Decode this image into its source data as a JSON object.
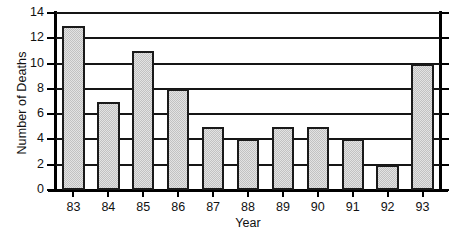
{
  "chart_data": {
    "type": "bar",
    "title": "",
    "xlabel": "Year",
    "ylabel": "Number of Deaths",
    "categories": [
      "83",
      "84",
      "85",
      "86",
      "87",
      "88",
      "89",
      "90",
      "91",
      "92",
      "93"
    ],
    "values": [
      13,
      7,
      11,
      8,
      5,
      4,
      5,
      5,
      4,
      2,
      10
    ],
    "ylim": [
      0,
      14
    ],
    "y_ticks": [
      0,
      2,
      4,
      6,
      8,
      10,
      12,
      14
    ],
    "y_tick_labels": [
      "0",
      "2",
      "4",
      "6",
      "8",
      "10",
      "12",
      "14"
    ],
    "grid": true,
    "grid_axis": "y",
    "legend": false,
    "legend_position": "none",
    "series": [
      {
        "name": "Number of Deaths",
        "values": [
          13,
          7,
          11,
          8,
          5,
          4,
          5,
          5,
          4,
          2,
          10
        ]
      }
    ],
    "colors": {
      "bar_fill": "#c2c2c2",
      "bar_edge": "#1a1a1a",
      "gridline": "#151515",
      "axis": "#000000",
      "text": "#111111",
      "background": "#ffffff"
    }
  }
}
